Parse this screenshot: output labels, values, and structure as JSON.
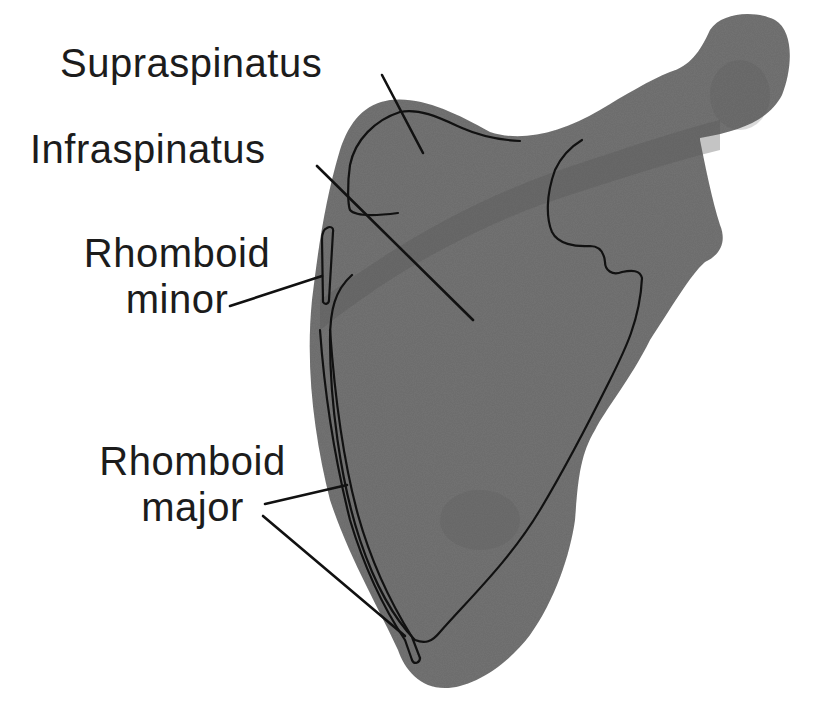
{
  "diagram": {
    "colors": {
      "background": "#ffffff",
      "bone_fill": "#737373",
      "bone_shadow": "#5e5e5e",
      "outline_stroke": "#111111",
      "label_text": "#1c1c1c"
    },
    "labels": [
      {
        "id": "supraspinatus",
        "lines": [
          "Supraspinatus"
        ]
      },
      {
        "id": "infraspinatus",
        "lines": [
          "Infraspinatus"
        ]
      },
      {
        "id": "rhomboid-minor",
        "lines": [
          "Rhomboid",
          "minor"
        ]
      },
      {
        "id": "rhomboid-major",
        "lines": [
          "Rhomboid",
          "major"
        ]
      }
    ]
  }
}
